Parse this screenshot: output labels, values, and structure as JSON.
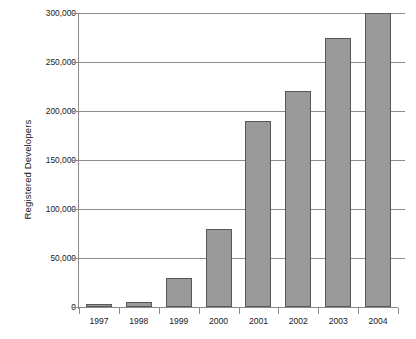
{
  "chart_data": {
    "type": "bar",
    "title": "",
    "subtitle": "",
    "xlabel": "",
    "ylabel": "Registered Developers",
    "categories": [
      "1997",
      "1998",
      "1999",
      "2000",
      "2001",
      "2002",
      "2003",
      "2004"
    ],
    "values": [
      3000,
      5000,
      30000,
      80000,
      190000,
      220000,
      275000,
      300000
    ],
    "ylim": [
      0,
      300000
    ],
    "yticks": [
      0,
      50000,
      100000,
      150000,
      200000,
      250000,
      300000
    ],
    "ytick_labels": [
      "0",
      "50,000",
      "100,000",
      "150,000",
      "200,000",
      "250,000",
      "300,000"
    ],
    "grid": true,
    "grid_axis": "y",
    "legend": false,
    "legend_position": "none",
    "annotations": [],
    "colors": {
      "bar_fill": "#9a9a9a",
      "bar_edge": "#585858",
      "gridline": "#8c8c8c",
      "axis": "#8c8c8c",
      "text": "#1a1a1a",
      "background": "#ffffff"
    }
  }
}
